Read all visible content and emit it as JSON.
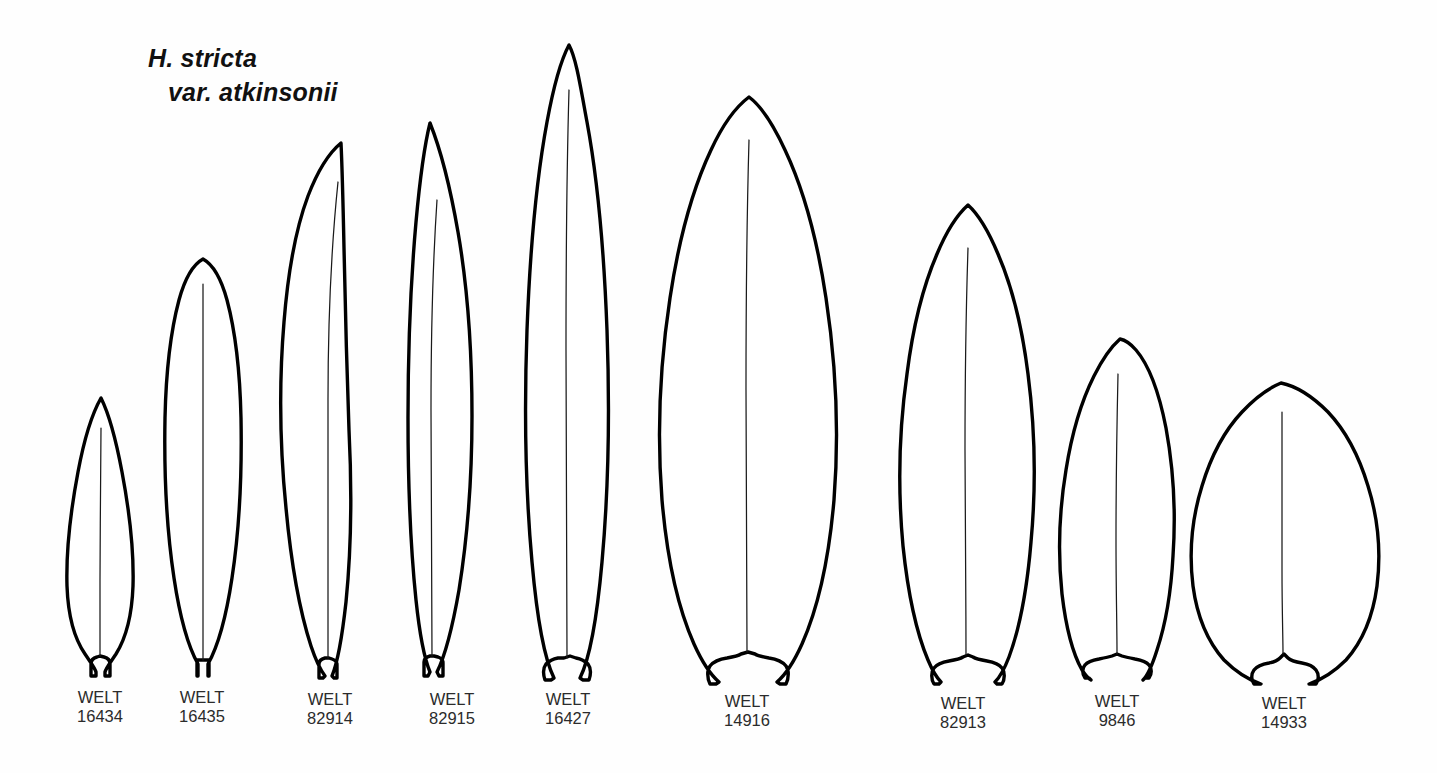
{
  "plate": {
    "taxon": {
      "line1": "H. stricta",
      "line2": "var. atkinsonii"
    },
    "background_color": "#fefefe",
    "ink_color": "#000000",
    "institution_code": "WELT",
    "specimen_count": 9,
    "specimens": [
      {
        "institution": "WELT",
        "number": "16434",
        "label_center_x": 100,
        "shape": "narrow-lanceolate",
        "apex_y": 398,
        "base_y": 676,
        "max_width": 62
      },
      {
        "institution": "WELT",
        "number": "16435",
        "label_center_x": 202,
        "shape": "narrow-elliptic",
        "apex_y": 258,
        "base_y": 676,
        "max_width": 74
      },
      {
        "institution": "WELT",
        "number": "82914",
        "label_center_x": 330,
        "shape": "linear-lanceolate",
        "apex_y": 142,
        "base_y": 678,
        "max_width": 80
      },
      {
        "institution": "WELT",
        "number": "82915",
        "label_center_x": 452,
        "shape": "narrow-lanceolate-falcate",
        "apex_y": 122,
        "base_y": 678,
        "max_width": 80
      },
      {
        "institution": "WELT",
        "number": "16427",
        "label_center_x": 568,
        "shape": "long-lanceolate",
        "apex_y": 44,
        "base_y": 680,
        "max_width": 96
      },
      {
        "institution": "WELT",
        "number": "14916",
        "label_center_x": 747,
        "shape": "broad-elliptic",
        "apex_y": 96,
        "base_y": 684,
        "max_width": 176
      },
      {
        "institution": "WELT",
        "number": "82913",
        "label_center_x": 963,
        "shape": "elliptic-lanceolate",
        "apex_y": 204,
        "base_y": 682,
        "max_width": 134
      },
      {
        "institution": "WELT",
        "number": "9846",
        "label_center_x": 1117,
        "shape": "elliptic",
        "apex_y": 338,
        "base_y": 678,
        "max_width": 110
      },
      {
        "institution": "WELT",
        "number": "14933",
        "label_center_x": 1284,
        "shape": "broadly-obovate",
        "apex_y": 382,
        "base_y": 682,
        "max_width": 172
      }
    ]
  }
}
